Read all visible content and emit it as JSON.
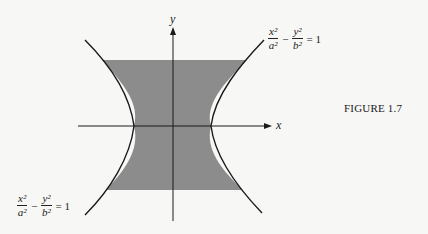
{
  "figure": {
    "caption": "FIGURE 1.7",
    "axis_x_label": "x",
    "axis_y_label": "y",
    "equation_top": {
      "x_num": "x²",
      "x_den": "a²",
      "y_num": "y²",
      "y_den": "b²",
      "op": "−",
      "rhs": "= 1"
    },
    "equation_bottom": {
      "x_num": "x²",
      "x_den": "a²",
      "y_num": "y²",
      "y_den": "b²",
      "op": "−",
      "rhs": "= 1"
    },
    "shade_color": "#8c8c8c",
    "curve_color": "#1a1a1a"
  }
}
